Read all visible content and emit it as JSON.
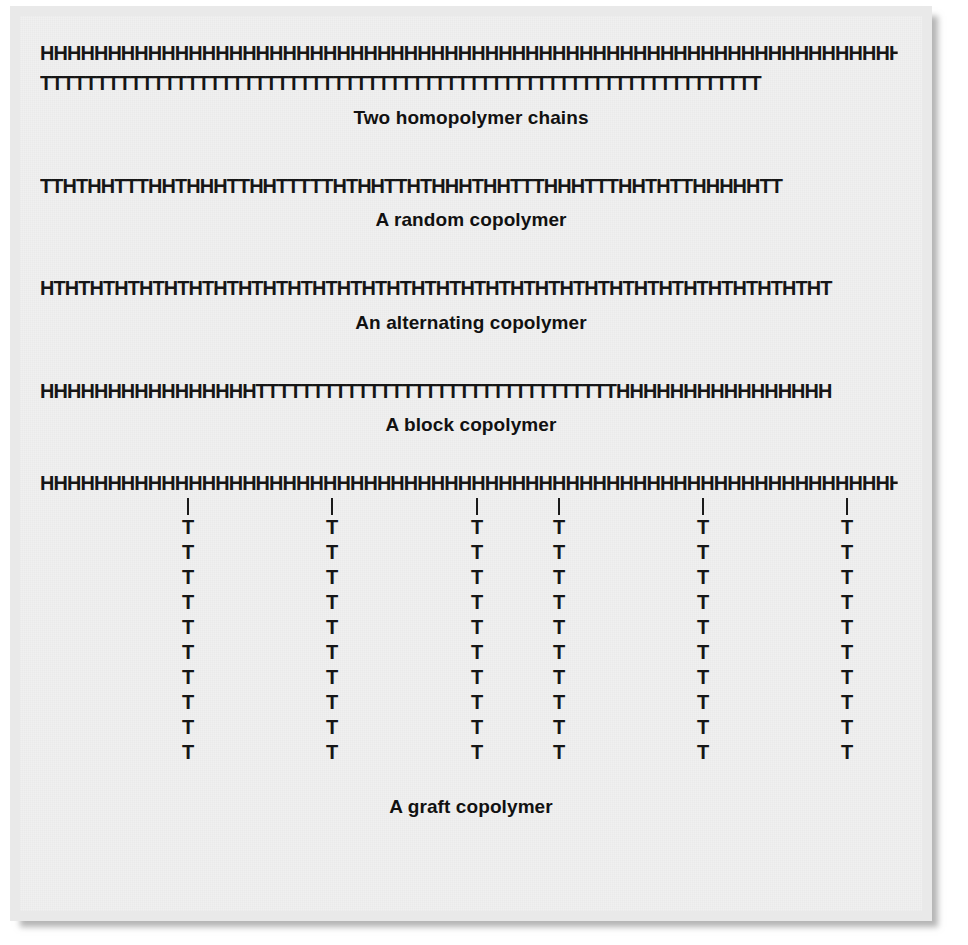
{
  "figure": {
    "background_color": "#f0f0f0",
    "frame_color": "#e9e9e9",
    "text_color": "#161616"
  },
  "monomers": {
    "head_label": "H",
    "tail_label": "T"
  },
  "panels": [
    {
      "id": "homopolymer",
      "caption": "Two homopolymer chains",
      "chains": [
        "HHHHHHHHHHHHHHHHHHHHHHHHHHHHHHHHHHHHHHHHHHHHHHHHHHHHHHHHHHHHHHHH",
        "TTTTTTTTTTTTTTTTTTTTTTTTTTTTTTTTTTTTTTTTTTTTTTTTTTTTTTTTTTTTTTTT"
      ]
    },
    {
      "id": "random",
      "caption": "A random copolymer",
      "chains": [
        "TTHTHHTTTHHTHHHTTHHTTTTTHTHHTTHTHHHTHHTTTHHHTTTHHTHTTHHHHHTT"
      ]
    },
    {
      "id": "alternating",
      "caption": "An alternating copolymer",
      "chains": [
        "HTHTHTHTHTHTHTHTHTHTHTHTHTHTHTHTHTHTHTHTHTHTHTHTHTHTHTHTHTHTHTHT"
      ]
    },
    {
      "id": "block",
      "caption": "A block copolymer",
      "chains": [
        "HHHHHHHHHHHHHHHHTTTTTTTTTTTTTTTTTTTTTTTTTTTTTTTTHHHHHHHHHHHHHHHH"
      ]
    },
    {
      "id": "graft",
      "caption": "A graft copolymer",
      "backbone": "HHHHHHHHHHHHHHHHHHHHHHHHHHHHHHHHHHHHHHHHHHHHHHHHHHHHHHHHHHHHHHHH",
      "branch_count": 6,
      "branch_length": 10,
      "branch_unit": "T",
      "branch_positions_px": [
        148,
        292,
        437,
        519,
        663,
        807
      ]
    }
  ]
}
